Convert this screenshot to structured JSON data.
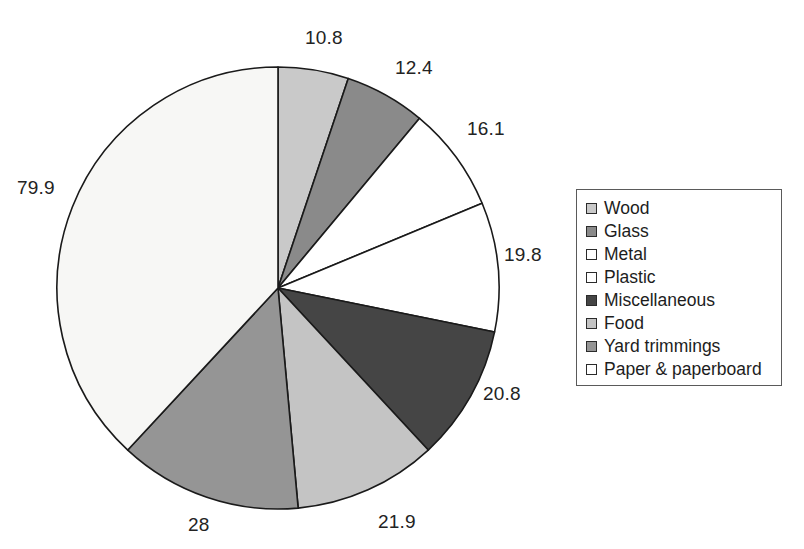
{
  "chart_data": {
    "type": "pie",
    "title": "",
    "subtitle": "",
    "xlabel": "",
    "ylabel": "",
    "grid": false,
    "legend_position": "right",
    "units": "million tons",
    "total": 209.7,
    "start_angle_deg": 0,
    "direction": "clockwise",
    "categories": [
      "Wood",
      "Glass",
      "Metal",
      "Plastic",
      "Miscellaneous",
      "Food",
      "Yard trimmings",
      "Paper & paperboard"
    ],
    "values": [
      10.8,
      12.4,
      16.1,
      19.8,
      20.8,
      21.9,
      28,
      79.9
    ],
    "slices": [
      {
        "label": "Wood",
        "value": 10.8,
        "value_text": "10.8",
        "color": "#c9c9c9"
      },
      {
        "label": "Glass",
        "value": 12.4,
        "value_text": "12.4",
        "color": "#8a8a8a"
      },
      {
        "label": "Metal",
        "value": 16.1,
        "value_text": "16.1",
        "color": "#ffffff"
      },
      {
        "label": "Plastic",
        "value": 19.8,
        "value_text": "19.8",
        "color": "#ffffff"
      },
      {
        "label": "Miscellaneous",
        "value": 20.8,
        "value_text": "20.8",
        "color": "#454545"
      },
      {
        "label": "Food",
        "value": 21.9,
        "value_text": "21.9",
        "color": "#c4c4c4"
      },
      {
        "label": "Yard trimmings",
        "value": 28,
        "value_text": "28",
        "color": "#959595"
      },
      {
        "label": "Paper & paperboard",
        "value": 79.9,
        "value_text": "79.9",
        "color": "#f7f7f5"
      }
    ],
    "data_labels": [
      {
        "text": "10.8",
        "x": 305,
        "y": 27
      },
      {
        "text": "12.4",
        "x": 395,
        "y": 57
      },
      {
        "text": "16.1",
        "x": 467,
        "y": 118
      },
      {
        "text": "19.8",
        "x": 504,
        "y": 244
      },
      {
        "text": "20.8",
        "x": 483,
        "y": 383
      },
      {
        "text": "21.9",
        "x": 378,
        "y": 511
      },
      {
        "text": "28",
        "x": 188,
        "y": 514
      },
      {
        "text": "79.9",
        "x": 17,
        "y": 177
      }
    ]
  },
  "legend": {
    "items": [
      {
        "label": "Wood",
        "swatch": "#c9c9c9"
      },
      {
        "label": "Glass",
        "swatch": "#8a8a8a"
      },
      {
        "label": "Metal",
        "swatch": "#ffffff"
      },
      {
        "label": "Plastic",
        "swatch": "#ffffff"
      },
      {
        "label": "Miscellaneous",
        "swatch": "#454545"
      },
      {
        "label": "Food",
        "swatch": "#c4c4c4"
      },
      {
        "label": "Yard trimmings",
        "swatch": "#959595"
      },
      {
        "label": "Paper & paperboard",
        "swatch": "#ffffff"
      }
    ]
  },
  "geometry": {
    "center_x": 278,
    "center_y": 288,
    "radius": 221,
    "stroke": "#1a1a1a",
    "stroke_width": 1.6
  }
}
